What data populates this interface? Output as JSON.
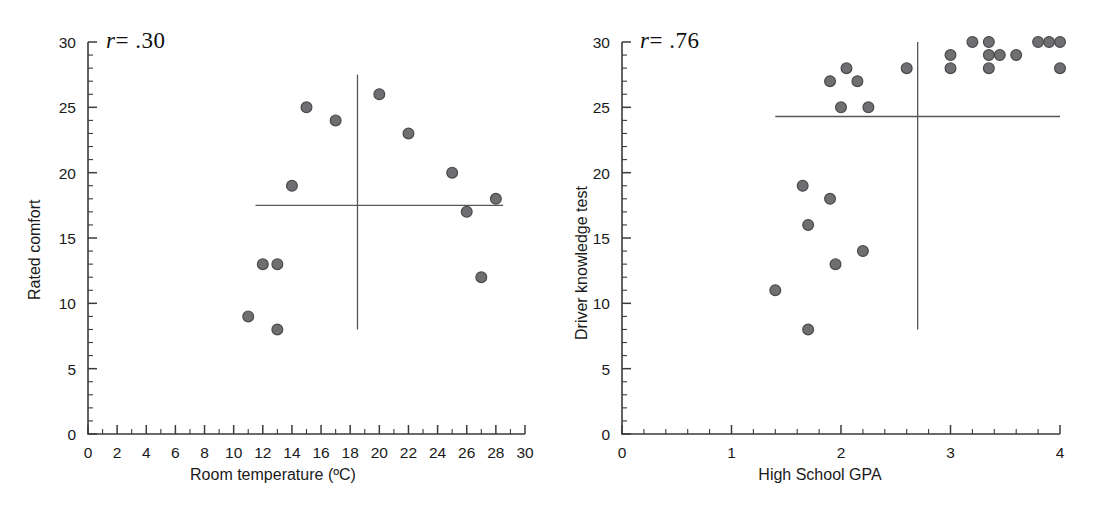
{
  "figure": {
    "background": "#ffffff",
    "point_color": "#6f6f72",
    "point_edge_color": "#4a4a4d",
    "axis_color": "#3b3b3b",
    "reference_line_color": "#55555a"
  },
  "chart_data": [
    {
      "type": "scatter",
      "panel": "left",
      "title": "",
      "annotation": "r = .30",
      "annotation_r_symbol": "r",
      "annotation_value": "= .30",
      "correlation": 0.3,
      "xlabel": "Room temperature (ºC)",
      "ylabel": "Rated comfort",
      "xlim": [
        0,
        30
      ],
      "ylim": [
        0,
        30
      ],
      "xticks": [
        0,
        2,
        4,
        6,
        8,
        10,
        12,
        14,
        16,
        18,
        20,
        22,
        24,
        26,
        28,
        30
      ],
      "xtick_labels": [
        "0",
        "2",
        "4",
        "6",
        "8",
        "10",
        "12",
        "14",
        "16",
        "18",
        "20",
        "22",
        "24",
        "26",
        "28",
        "30"
      ],
      "yticks": [
        0,
        5,
        10,
        15,
        20,
        25,
        30
      ],
      "ytick_labels": [
        "0",
        "5",
        "10",
        "15",
        "20",
        "25",
        "30"
      ],
      "x_minor_tick_step": 1,
      "y_minor_tick_step": 1,
      "grid": false,
      "legend": false,
      "points": [
        {
          "x": 11,
          "y": 9
        },
        {
          "x": 12,
          "y": 13
        },
        {
          "x": 13,
          "y": 13
        },
        {
          "x": 13,
          "y": 8
        },
        {
          "x": 14,
          "y": 19
        },
        {
          "x": 15,
          "y": 25
        },
        {
          "x": 17,
          "y": 24
        },
        {
          "x": 20,
          "y": 26
        },
        {
          "x": 22,
          "y": 23
        },
        {
          "x": 25,
          "y": 20
        },
        {
          "x": 26,
          "y": 17
        },
        {
          "x": 27,
          "y": 12
        },
        {
          "x": 28,
          "y": 18
        }
      ],
      "reference_lines": {
        "horizontal_mean_y": 17.5,
        "horizontal_x_range": [
          11.5,
          28.5
        ],
        "vertical_mean_x": 18.5,
        "vertical_y_range": [
          8,
          27.5
        ]
      }
    },
    {
      "type": "scatter",
      "panel": "right",
      "title": "",
      "annotation": "r = .76",
      "annotation_r_symbol": "r",
      "annotation_value": "= .76",
      "correlation": 0.76,
      "xlabel": "High School GPA",
      "ylabel": "Driver knowledge test",
      "xlim": [
        0,
        4
      ],
      "ylim": [
        0,
        30
      ],
      "xticks": [
        0,
        1,
        2,
        3,
        4
      ],
      "xtick_labels": [
        "0",
        "1",
        "2",
        "3",
        "4"
      ],
      "yticks": [
        0,
        5,
        10,
        15,
        20,
        25,
        30
      ],
      "ytick_labels": [
        "0",
        "5",
        "10",
        "15",
        "20",
        "25",
        "30"
      ],
      "x_minor_tick_step": 0.2,
      "y_minor_tick_step": 1,
      "grid": false,
      "legend": false,
      "points": [
        {
          "x": 1.4,
          "y": 11
        },
        {
          "x": 1.65,
          "y": 19
        },
        {
          "x": 1.7,
          "y": 16
        },
        {
          "x": 1.7,
          "y": 8
        },
        {
          "x": 1.9,
          "y": 27
        },
        {
          "x": 1.9,
          "y": 18
        },
        {
          "x": 1.95,
          "y": 13
        },
        {
          "x": 2.05,
          "y": 28
        },
        {
          "x": 2.0,
          "y": 25
        },
        {
          "x": 2.15,
          "y": 27
        },
        {
          "x": 2.2,
          "y": 14
        },
        {
          "x": 2.25,
          "y": 25
        },
        {
          "x": 2.6,
          "y": 28
        },
        {
          "x": 3.0,
          "y": 29
        },
        {
          "x": 3.0,
          "y": 28
        },
        {
          "x": 3.2,
          "y": 30
        },
        {
          "x": 3.35,
          "y": 30
        },
        {
          "x": 3.35,
          "y": 29
        },
        {
          "x": 3.35,
          "y": 28
        },
        {
          "x": 3.45,
          "y": 29
        },
        {
          "x": 3.6,
          "y": 29
        },
        {
          "x": 3.8,
          "y": 30
        },
        {
          "x": 3.9,
          "y": 30
        },
        {
          "x": 4.0,
          "y": 30
        },
        {
          "x": 4.0,
          "y": 28
        }
      ],
      "reference_lines": {
        "horizontal_mean_y": 24.3,
        "horizontal_x_range": [
          1.4,
          4.0
        ],
        "vertical_mean_x": 2.7,
        "vertical_y_range": [
          8,
          30
        ]
      }
    }
  ]
}
